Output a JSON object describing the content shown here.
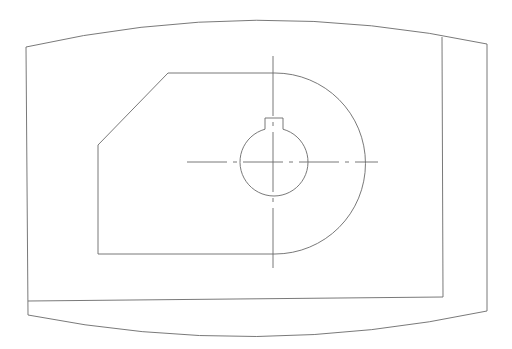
{
  "drawing": {
    "type": "technical line drawing",
    "stroke_color": "#6a6a6a",
    "background": "#ffffff",
    "frame": {
      "outer": "M26,47 Q256,-5 487,44 L487,311 Q256,360 28,315 Z",
      "inner_right_edge": "M442,37 L443,297",
      "inner_bottom_edge": "M28,301 L443,297"
    },
    "part": {
      "outline": "M168,73 L275,73 A90,90 0 0 1 275,254 L98,254 L98,145 Z",
      "bore": {
        "cx": 274,
        "cy": 162,
        "r": 34
      },
      "keyway": {
        "x1": 265,
        "x2": 283,
        "top": 118
      },
      "centerline_h": {
        "x1": 187,
        "x2": 378,
        "y": 162
      },
      "centerline_v": {
        "x": 273,
        "y1": 56,
        "y2": 272
      }
    }
  }
}
